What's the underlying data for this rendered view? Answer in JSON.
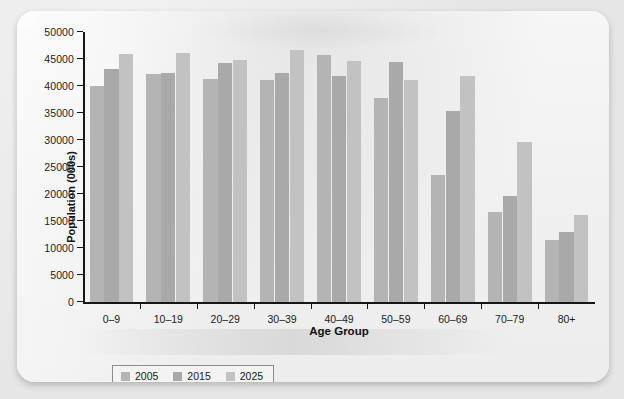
{
  "chart_data": {
    "type": "bar",
    "title": "",
    "xlabel": "Age Group",
    "ylabel": "Population (000s)",
    "categories": [
      "0–9",
      "10–19",
      "20–29",
      "30–39",
      "40–49",
      "50–59",
      "60–69",
      "70–79",
      "80+"
    ],
    "series": [
      {
        "name": "2005",
        "color": "#b4b4b4",
        "values": [
          40000,
          42300,
          41300,
          41200,
          45700,
          37800,
          23500,
          16600,
          11400
        ]
      },
      {
        "name": "2015",
        "color": "#a9a9a9",
        "values": [
          43100,
          42500,
          44300,
          42500,
          41800,
          44500,
          35300,
          19700,
          12900
        ]
      },
      {
        "name": "2025",
        "color": "#c2c2c2",
        "values": [
          46000,
          46100,
          44800,
          46700,
          44700,
          41200,
          41900,
          29700,
          16100
        ]
      }
    ],
    "ylim": [
      0,
      50000
    ],
    "yticks": [
      0,
      5000,
      10000,
      15000,
      20000,
      25000,
      30000,
      35000,
      40000,
      45000,
      50000
    ],
    "ytick_labels": [
      "0",
      "5000",
      "10000",
      "15000",
      "20000",
      "25000",
      "30000",
      "35000",
      "40000",
      "45000",
      "50000"
    ],
    "grid": false,
    "legend_position": "bottom-left",
    "legend_entries": [
      "2005",
      "2015",
      "2025"
    ]
  },
  "axes": {
    "y_title": "Population (000s)",
    "x_title": "Age Group"
  }
}
